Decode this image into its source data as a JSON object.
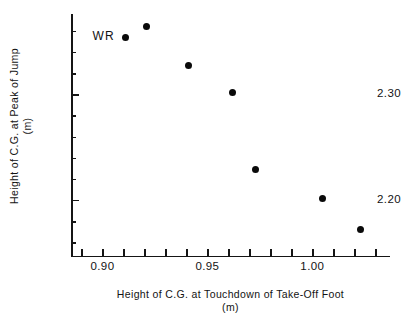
{
  "chart_data": {
    "type": "scatter",
    "title": "",
    "xlabel": "Height of C.G. at Touchdown of Take-Off Foot",
    "xunit": "(m)",
    "ylabel": "Height of C.G. at Peak of Jump",
    "yunit": "(m)",
    "xlim": [
      0.885,
      1.037
    ],
    "ylim": [
      2.147,
      2.376
    ],
    "grid": false,
    "legend": null,
    "x_ticks_major": [
      {
        "value": 0.9,
        "label": "0.90"
      },
      {
        "value": 0.95,
        "label": "0.95"
      },
      {
        "value": 1.0,
        "label": "1.00"
      }
    ],
    "x_ticks_minor": [
      0.89,
      0.91,
      0.92,
      0.93,
      0.94,
      0.96,
      0.97,
      0.98,
      0.99,
      1.01,
      1.02,
      1.03
    ],
    "y_ticks_major": [
      {
        "value": 2.3,
        "label": "2.30"
      },
      {
        "value": 2.2,
        "label": "2.20"
      }
    ],
    "y_ticks_minor": [
      2.36,
      2.34,
      2.32,
      2.28,
      2.26,
      2.24,
      2.22,
      2.18,
      2.16
    ],
    "points": [
      {
        "x": 0.911,
        "y": 2.354,
        "label": "WR"
      },
      {
        "x": 0.921,
        "y": 2.364,
        "label": ""
      },
      {
        "x": 0.941,
        "y": 2.327,
        "label": ""
      },
      {
        "x": 0.962,
        "y": 2.302,
        "label": ""
      },
      {
        "x": 0.973,
        "y": 2.229,
        "label": ""
      },
      {
        "x": 1.005,
        "y": 2.201,
        "label": ""
      },
      {
        "x": 1.023,
        "y": 2.172,
        "label": ""
      }
    ],
    "annotations": [
      {
        "text": "WR",
        "x": 0.911,
        "y": 2.354,
        "position": "left"
      }
    ],
    "colors": {
      "marker": "#0a0a0a",
      "axis": "#151515",
      "text": "#131313",
      "background": "#ffffff"
    }
  }
}
